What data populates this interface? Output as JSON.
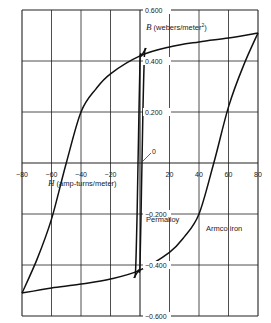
{
  "chart_data": {
    "type": "line",
    "title": "",
    "xlabel": "H (amp-turns/meter)",
    "ylabel": "B (webers/meter²)",
    "xlim": [
      -80,
      80
    ],
    "ylim": [
      -0.6,
      0.6
    ],
    "grid": true,
    "x_ticks": [
      "-80",
      "-60",
      "-40",
      "-20",
      "20",
      "40",
      "60",
      "80"
    ],
    "y_ticks": [
      "0.600",
      "0.400",
      "0.200",
      "0",
      "-0.200",
      "-0.400",
      "-0.600"
    ],
    "annotations": [
      "Permalloy",
      "Armco iron",
      "0"
    ],
    "series": [
      {
        "name": "Armco iron",
        "upper_branch": {
          "x": [
            80,
            60,
            40,
            20,
            0,
            -20,
            -30,
            -40,
            -50,
            -60,
            -70,
            -80
          ],
          "y": [
            0.51,
            0.49,
            0.475,
            0.455,
            0.42,
            0.35,
            0.29,
            0.2,
            0.0,
            -0.22,
            -0.38,
            -0.51
          ]
        },
        "lower_branch": {
          "x": [
            -80,
            -60,
            -40,
            -20,
            0,
            20,
            30,
            40,
            50,
            60,
            70,
            80
          ],
          "y": [
            -0.51,
            -0.49,
            -0.475,
            -0.455,
            -0.42,
            -0.35,
            -0.29,
            -0.2,
            0.0,
            0.22,
            0.38,
            0.51
          ]
        }
      },
      {
        "name": "Permalloy",
        "upper_branch": {
          "x": [
            4,
            3,
            2,
            1,
            0,
            -1,
            -2,
            -3,
            -4
          ],
          "y": [
            0.45,
            0.44,
            0.43,
            0.42,
            0.4,
            0.1,
            -0.2,
            -0.42,
            -0.45
          ]
        },
        "lower_branch": {
          "x": [
            -4,
            -3,
            -2,
            -1,
            0,
            1,
            2,
            3,
            4
          ],
          "y": [
            -0.45,
            -0.44,
            -0.43,
            -0.42,
            -0.4,
            -0.1,
            0.2,
            0.42,
            0.45
          ]
        }
      }
    ]
  },
  "labels": {
    "y_axis_title": "B (webers/meter",
    "y_axis_sup": "2",
    "y_axis_close": ")",
    "x_axis_title_sym": "H",
    "x_axis_title_rest": " (amp-turns/meter)",
    "permalloy": "Permalloy",
    "armco": "Armco iron",
    "origin": "0"
  },
  "colors": {
    "line": "#111111",
    "grid": "#222222",
    "background": "#ffffff"
  }
}
